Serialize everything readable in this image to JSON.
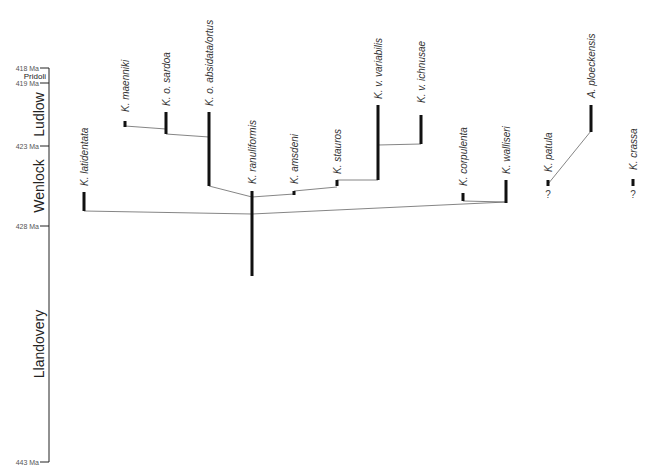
{
  "timescale": {
    "ticks": [
      {
        "label": "418 Ma",
        "y": 68
      },
      {
        "label": "419 Ma",
        "y": 83
      },
      {
        "label": "423 Ma",
        "y": 146
      },
      {
        "label": "428 Ma",
        "y": 226
      },
      {
        "label": "443 Ma",
        "y": 462
      }
    ],
    "epochs": [
      {
        "name": "Pridoli",
        "y_top": 68,
        "y_bottom": 83,
        "size": 8,
        "rotated": false
      },
      {
        "name": "Ludlow",
        "y_top": 83,
        "y_bottom": 146,
        "size": 14,
        "rotated": true
      },
      {
        "name": "Wenlock",
        "y_top": 146,
        "y_bottom": 226,
        "size": 14,
        "rotated": true
      },
      {
        "name": "Llandovery",
        "y_top": 226,
        "y_bottom": 462,
        "size": 14,
        "rotated": true
      }
    ]
  },
  "taxa": [
    {
      "name": "K. latidentata",
      "x": 84,
      "y_top": 192,
      "y_bottom": 211,
      "label_y": 186
    },
    {
      "name": "K. maenniki",
      "x": 125,
      "y_top": 121,
      "y_bottom": 127,
      "label_y": 112
    },
    {
      "name": "K. o. sardoa",
      "x": 166,
      "y_top": 112,
      "y_bottom": 134,
      "label_y": 106
    },
    {
      "name": "K. o. absidata/ortus",
      "x": 209,
      "y_top": 112,
      "y_bottom": 186,
      "label_y": 106
    },
    {
      "name": "K. ranuliformis",
      "x": 252,
      "y_top": 191,
      "y_bottom": 276,
      "label_y": 184
    },
    {
      "name": "K. amsdeni",
      "x": 294,
      "y_top": 191,
      "y_bottom": 195,
      "label_y": 184
    },
    {
      "name": "K. stauros",
      "x": 337,
      "y_top": 180,
      "y_bottom": 186,
      "label_y": 174
    },
    {
      "name": "K. v. variabilis",
      "x": 378,
      "y_top": 105,
      "y_bottom": 180,
      "label_y": 99
    },
    {
      "name": "K. v. ichnusae",
      "x": 421,
      "y_top": 115,
      "y_bottom": 144,
      "label_y": 103
    },
    {
      "name": "K. corpulenta",
      "x": 463,
      "y_top": 193,
      "y_bottom": 201,
      "label_y": 186
    },
    {
      "name": "K. walliseri",
      "x": 506,
      "y_top": 180,
      "y_bottom": 203,
      "label_y": 174
    },
    {
      "name": "K. patula",
      "x": 548,
      "y_top": 180,
      "y_bottom": 186,
      "label_y": 172,
      "question": "?"
    },
    {
      "name": "A. ploeckensis",
      "x": 591,
      "y_top": 105,
      "y_bottom": 132,
      "label_y": 98
    },
    {
      "name": "K. crassa",
      "x": 633,
      "y_top": 179,
      "y_bottom": 186,
      "label_y": 170,
      "question": "?"
    }
  ],
  "connectors": [
    {
      "from": "K. maenniki",
      "x1": 125,
      "y1": 126,
      "x2": 166,
      "y2": 129
    },
    {
      "from": "K. o. sardoa",
      "x1": 166,
      "y1": 134,
      "x2": 209,
      "y2": 137
    },
    {
      "from": "K. o. absidata/ortus",
      "x1": 209,
      "y1": 186,
      "x2": 252,
      "y2": 197
    },
    {
      "from": "K. amsdeni",
      "x1": 252,
      "y1": 197,
      "x2": 294,
      "y2": 194
    },
    {
      "from": "K. stauros",
      "x1": 294,
      "y1": 191,
      "x2": 337,
      "y2": 187
    },
    {
      "from": "K. v. variabilis",
      "x1": 337,
      "y1": 180,
      "x2": 378,
      "y2": 180
    },
    {
      "from": "K. v. ichnusae",
      "x1": 378,
      "y1": 145,
      "x2": 421,
      "y2": 144
    },
    {
      "from": "K. latidentata",
      "x1": 84,
      "y1": 211,
      "x2": 252,
      "y2": 214
    },
    {
      "from": "K. walliseri-branch",
      "x1": 252,
      "y1": 214,
      "x2": 506,
      "y2": 202
    },
    {
      "from": "K. corpulenta",
      "x1": 463,
      "y1": 201,
      "x2": 506,
      "y2": 202
    },
    {
      "from": "K. patula",
      "x1": 548,
      "y1": 184,
      "x2": 591,
      "y2": 131
    }
  ],
  "colors": {
    "axis": "#222222",
    "bar": "#111111",
    "connector": "#666666",
    "text": "#333333"
  }
}
